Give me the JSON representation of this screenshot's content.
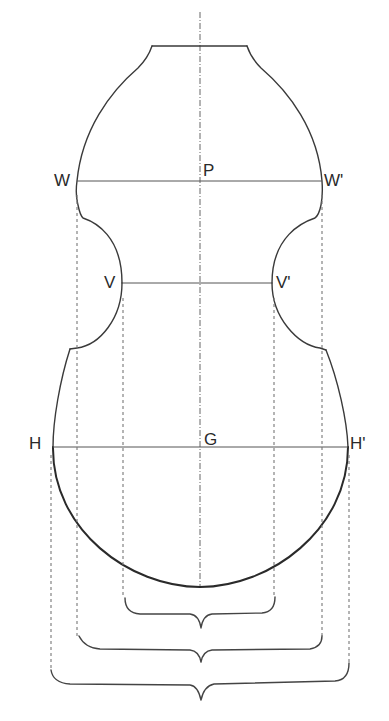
{
  "figure": {
    "type": "violin-body-outline-construction",
    "labels": {
      "W": "W",
      "W_prime": "W'",
      "P": "P",
      "V": "V",
      "V_prime": "V'",
      "H": "H",
      "H_prime": "H'",
      "G": "G"
    },
    "measurement_lines": [
      {
        "name": "upper-bout-width",
        "from": "W",
        "to": "W'",
        "center": "P"
      },
      {
        "name": "waist-width",
        "from": "V",
        "to": "V'"
      },
      {
        "name": "lower-bout-width",
        "from": "H",
        "to": "H'",
        "center": "G"
      }
    ],
    "braces": [
      {
        "name": "waist-width-brace",
        "spans": "V to V'"
      },
      {
        "name": "upper-bout-width-brace",
        "spans": "W to W'"
      },
      {
        "name": "lower-bout-width-brace",
        "spans": "H to H'"
      }
    ],
    "colors": {
      "line": "#3a3a3a",
      "background": "#ffffff"
    }
  }
}
